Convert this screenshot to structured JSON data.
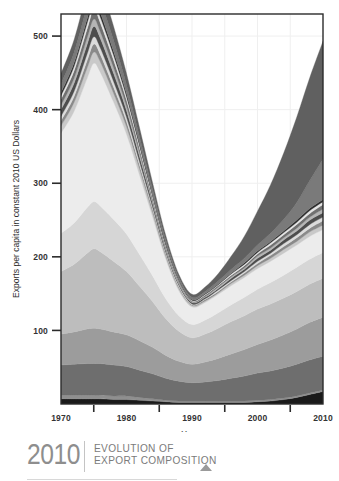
{
  "chart_data": {
    "type": "area",
    "title": "",
    "xlabel": "Years",
    "ylabel": "Exports per capita in constant 2010 US Dollars",
    "xlim": [
      1970,
      2010
    ],
    "ylim": [
      0,
      530
    ],
    "grid": true,
    "legend_position": "none",
    "stacked": true,
    "x": [
      1970,
      1972,
      1974,
      1975,
      1976,
      1978,
      1980,
      1982,
      1984,
      1986,
      1988,
      1990,
      1992,
      1994,
      1996,
      1998,
      2000,
      2002,
      2004,
      2006,
      2008,
      2010
    ],
    "xticks": [
      1970,
      1980,
      1990,
      2000,
      2010
    ],
    "xticklabels": [
      "1970",
      "1980",
      "1990",
      "2000",
      "2010"
    ],
    "xminorticks": [
      1975,
      1985,
      1995,
      2005
    ],
    "yticks": [
      100,
      200,
      300,
      400,
      500
    ],
    "yticklabels": [
      "100",
      "200",
      "300",
      "400",
      "500"
    ],
    "series": [
      {
        "name": "layer-1",
        "color": "#1a1a1a",
        "values": [
          7,
          7,
          7,
          7,
          7,
          6,
          6,
          5,
          4,
          3,
          2,
          2,
          2,
          2,
          2,
          2,
          3,
          4,
          6,
          9,
          13,
          17
        ]
      },
      {
        "name": "layer-2",
        "color": "#8f8f8f",
        "values": [
          5,
          5,
          5,
          5,
          5,
          5,
          5,
          4,
          3,
          2,
          2,
          2,
          2,
          2,
          2,
          2,
          2,
          2,
          2,
          2,
          2,
          2
        ]
      },
      {
        "name": "layer-3",
        "color": "#6e6e6e",
        "values": [
          41,
          42,
          43,
          43,
          43,
          42,
          40,
          37,
          34,
          30,
          27,
          25,
          26,
          28,
          31,
          34,
          37,
          39,
          41,
          43,
          45,
          46
        ]
      },
      {
        "name": "layer-4",
        "color": "#9c9c9c",
        "values": [
          42,
          44,
          47,
          48,
          47,
          45,
          43,
          40,
          36,
          31,
          27,
          25,
          27,
          30,
          33,
          36,
          39,
          42,
          45,
          48,
          51,
          53
        ]
      },
      {
        "name": "layer-5",
        "color": "#bdbdbd",
        "values": [
          85,
          92,
          103,
          108,
          105,
          96,
          86,
          74,
          62,
          50,
          41,
          36,
          38,
          41,
          44,
          46,
          48,
          49,
          50,
          51,
          52,
          53
        ]
      },
      {
        "name": "layer-6",
        "color": "#d6d6d6",
        "values": [
          52,
          56,
          62,
          64,
          62,
          57,
          51,
          43,
          35,
          27,
          21,
          18,
          19,
          21,
          23,
          25,
          27,
          29,
          31,
          33,
          34,
          35
        ]
      },
      {
        "name": "layer-7",
        "color": "#ececec",
        "values": [
          136,
          152,
          176,
          188,
          182,
          160,
          136,
          108,
          80,
          54,
          34,
          24,
          24,
          25,
          26,
          27,
          28,
          29,
          30,
          30,
          31,
          31
        ]
      },
      {
        "name": "layer-8",
        "color": "#c9c9c9",
        "values": [
          10,
          12,
          14,
          15,
          14,
          12,
          10,
          8,
          6,
          4,
          3,
          2,
          2,
          2,
          3,
          3,
          4,
          4,
          5,
          5,
          6,
          6
        ]
      },
      {
        "name": "layer-9",
        "color": "#8a8a8a",
        "values": [
          7,
          8,
          10,
          11,
          10,
          8,
          7,
          5,
          4,
          3,
          2,
          1,
          2,
          2,
          2,
          3,
          3,
          4,
          4,
          5,
          5,
          6
        ]
      },
      {
        "name": "layer-10",
        "color": "#dcdcdc",
        "values": [
          6,
          7,
          9,
          10,
          9,
          8,
          6,
          5,
          3,
          2,
          2,
          1,
          1,
          2,
          2,
          2,
          3,
          3,
          4,
          4,
          5,
          5
        ]
      },
      {
        "name": "layer-11",
        "color": "#4d4d4d",
        "values": [
          9,
          11,
          13,
          14,
          13,
          11,
          9,
          7,
          5,
          3,
          2,
          2,
          2,
          2,
          3,
          3,
          4,
          4,
          5,
          5,
          6,
          6
        ]
      },
      {
        "name": "layer-12",
        "color": "#b5b5b5",
        "values": [
          6,
          7,
          9,
          10,
          9,
          8,
          6,
          5,
          3,
          2,
          2,
          1,
          1,
          2,
          2,
          2,
          3,
          3,
          3,
          4,
          4,
          5
        ]
      },
      {
        "name": "layer-13",
        "color": "#707070",
        "values": [
          8,
          10,
          12,
          13,
          12,
          10,
          8,
          6,
          4,
          3,
          2,
          1,
          2,
          2,
          2,
          3,
          3,
          4,
          4,
          5,
          5,
          6
        ]
      },
      {
        "name": "layer-14",
        "color": "#e4e4e4",
        "values": [
          5,
          6,
          8,
          9,
          8,
          7,
          5,
          4,
          3,
          2,
          1,
          1,
          1,
          1,
          2,
          2,
          2,
          3,
          3,
          3,
          4,
          4
        ]
      },
      {
        "name": "layer-15",
        "color": "#2e2e2e",
        "values": [
          4,
          5,
          6,
          7,
          6,
          5,
          4,
          3,
          2,
          2,
          1,
          1,
          1,
          1,
          1,
          2,
          2,
          2,
          2,
          3,
          3,
          3
        ]
      },
      {
        "name": "layer-16",
        "color": "#7a7a7a",
        "values": [
          12,
          14,
          17,
          18,
          17,
          15,
          12,
          9,
          7,
          5,
          3,
          3,
          3,
          4,
          5,
          6,
          8,
          11,
          16,
          24,
          38,
          55
        ]
      },
      {
        "name": "layer-17",
        "color": "#606060",
        "values": [
          14,
          17,
          21,
          23,
          22,
          19,
          15,
          12,
          9,
          6,
          4,
          4,
          6,
          10,
          18,
          30,
          46,
          66,
          90,
          116,
          140,
          160
        ]
      }
    ]
  },
  "yaxis": {
    "title": "Exports per capita in constant 2010 US Dollars"
  },
  "xaxis": {
    "title": "Years"
  },
  "footer": {
    "year": "2010",
    "line1": "EVOLUTION OF",
    "line2": "EXPORT COMPOSITION"
  },
  "colors": {
    "axis": "#2b2b2b",
    "grid": "#efefef",
    "tick_text": "#333333",
    "footer_year": "#8e8e8e",
    "footer_text": "#7b7b7b",
    "footer_triangle": "#9a9a9a"
  }
}
